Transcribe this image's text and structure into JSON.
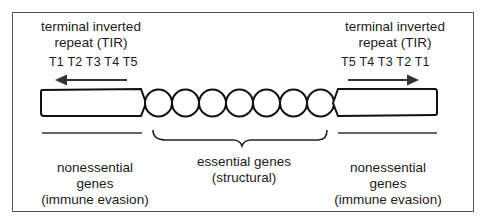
{
  "figure": {
    "left_tir": {
      "title_line1": "terminal inverted",
      "title_line2": "repeat (TIR)",
      "repeats": "T1 T2 T3 T4 T5",
      "arrow_direction": "left"
    },
    "right_tir": {
      "title_line1": "terminal inverted",
      "title_line2": "repeat (TIR)",
      "repeats": "T5 T4 T3 T2 T1",
      "arrow_direction": "right"
    },
    "left_region": {
      "line1": "nonessential",
      "line2": "genes",
      "line3": "(immune evasion)"
    },
    "center_region": {
      "line1": "essential genes",
      "line2": "(structural)",
      "circle_count": 7
    },
    "right_region": {
      "line1": "nonessential",
      "line2": "genes",
      "line3": "(immune evasion)"
    },
    "colors": {
      "stroke": "#111111",
      "arrow": "#333333",
      "frame": "#555555"
    }
  }
}
